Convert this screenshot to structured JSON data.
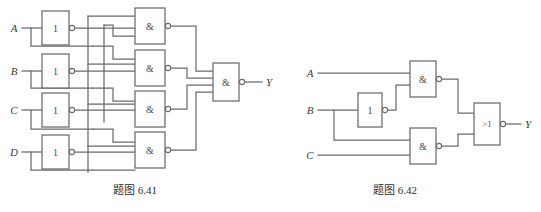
{
  "figure_set": {
    "background_color": "#ffffff",
    "line_color": "#6b6b6b",
    "text_color": "#2e2e2e"
  },
  "figures": [
    {
      "id": "fig-6-41",
      "caption": "题图 6.41",
      "description": "Four-variable NAND-NAND combinational logic network",
      "inputs": [
        {
          "name": "A",
          "label": "A"
        },
        {
          "name": "B",
          "label": "B"
        },
        {
          "name": "C",
          "label": "C"
        },
        {
          "name": "D",
          "label": "D"
        }
      ],
      "outputs": [
        {
          "name": "Y",
          "label": "Y"
        }
      ],
      "gates": [
        {
          "id": "inv-a",
          "type": "not",
          "label": "1",
          "inverted_output": true,
          "inputs": 1
        },
        {
          "id": "inv-b",
          "type": "not",
          "label": "1",
          "inverted_output": true,
          "inputs": 1
        },
        {
          "id": "inv-c",
          "type": "not",
          "label": "1",
          "inverted_output": true,
          "inputs": 1
        },
        {
          "id": "inv-d",
          "type": "not",
          "label": "1",
          "inverted_output": true,
          "inputs": 1
        },
        {
          "id": "nand-1",
          "type": "nand",
          "label": "&",
          "inverted_output": true,
          "inputs": 3
        },
        {
          "id": "nand-2",
          "type": "nand",
          "label": "&",
          "inverted_output": true,
          "inputs": 3
        },
        {
          "id": "nand-3",
          "type": "nand",
          "label": "&",
          "inverted_output": true,
          "inputs": 3
        },
        {
          "id": "nand-4",
          "type": "nand",
          "label": "&",
          "inverted_output": true,
          "inputs": 3
        },
        {
          "id": "nand-out",
          "type": "nand",
          "label": "&",
          "inverted_output": true,
          "inputs": 4
        }
      ]
    },
    {
      "id": "fig-6-42",
      "caption": "题图 6.42",
      "description": "Three-variable NAND into NOR combinational logic network",
      "inputs": [
        {
          "name": "A",
          "label": "A"
        },
        {
          "name": "B",
          "label": "B"
        },
        {
          "name": "C",
          "label": "C"
        }
      ],
      "outputs": [
        {
          "name": "Y",
          "label": "Y"
        }
      ],
      "gates": [
        {
          "id": "inv-b2",
          "type": "not",
          "label": "1",
          "inverted_output": true,
          "inputs": 1
        },
        {
          "id": "nand-t",
          "type": "nand",
          "label": "&",
          "inverted_output": true,
          "inputs": 2
        },
        {
          "id": "nand-b",
          "type": "nand",
          "label": "&",
          "inverted_output": true,
          "inputs": 2
        },
        {
          "id": "nor-out",
          "type": "nor",
          "label": ">1",
          "inverted_output": true,
          "inputs": 2
        }
      ]
    }
  ]
}
